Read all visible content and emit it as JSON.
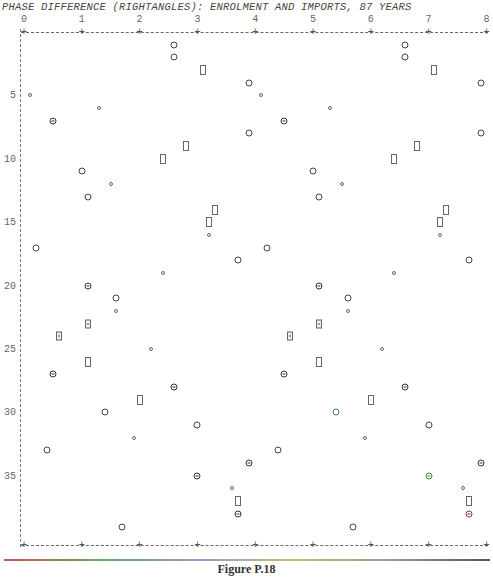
{
  "chart_data": {
    "type": "scatter",
    "title": "PHASE DIFFERENCE (RIGHTANGLES):  ENROLMENT AND IMPORTS, 87 YEARS",
    "xlabel": "Phase difference (right angles)",
    "ylabel": "Row / year index",
    "x_ticks": [
      "0",
      "1",
      "2",
      "3",
      "4",
      "5",
      "6",
      "7",
      "8"
    ],
    "y_ticks": [
      "5",
      "10",
      "15",
      "20",
      "25",
      "30",
      "35"
    ],
    "xlim": [
      0,
      8
    ],
    "ylim": [
      0,
      40
    ],
    "grid": false,
    "legend": null,
    "markers": {
      "circle": "large circle",
      "small": "small circle",
      "theta": "crossed circle",
      "rect": "open rectangle",
      "dbl": "boxed double symbol"
    },
    "points": [
      {
        "x": 2.6,
        "y": 1,
        "m": "circle"
      },
      {
        "x": 6.6,
        "y": 1,
        "m": "circle"
      },
      {
        "x": 2.6,
        "y": 2,
        "m": "circle"
      },
      {
        "x": 6.6,
        "y": 2,
        "m": "circle"
      },
      {
        "x": 3.1,
        "y": 3,
        "m": "rect"
      },
      {
        "x": 7.1,
        "y": 3,
        "m": "rect"
      },
      {
        "x": 3.9,
        "y": 4,
        "m": "circle"
      },
      {
        "x": 7.9,
        "y": 4,
        "m": "circle"
      },
      {
        "x": 0.1,
        "y": 5,
        "m": "small"
      },
      {
        "x": 4.1,
        "y": 5,
        "m": "small"
      },
      {
        "x": 1.3,
        "y": 6,
        "m": "small"
      },
      {
        "x": 5.3,
        "y": 6,
        "m": "small"
      },
      {
        "x": 0.5,
        "y": 7,
        "m": "theta"
      },
      {
        "x": 4.5,
        "y": 7,
        "m": "theta"
      },
      {
        "x": 3.9,
        "y": 8,
        "m": "circle"
      },
      {
        "x": 7.9,
        "y": 8,
        "m": "circle"
      },
      {
        "x": 2.8,
        "y": 9,
        "m": "rect"
      },
      {
        "x": 6.8,
        "y": 9,
        "m": "rect"
      },
      {
        "x": 2.4,
        "y": 10,
        "m": "rect"
      },
      {
        "x": 6.4,
        "y": 10,
        "m": "rect"
      },
      {
        "x": 1.0,
        "y": 11,
        "m": "circle"
      },
      {
        "x": 5.0,
        "y": 11,
        "m": "circle"
      },
      {
        "x": 1.5,
        "y": 12,
        "m": "small"
      },
      {
        "x": 5.5,
        "y": 12,
        "m": "small"
      },
      {
        "x": 1.1,
        "y": 13,
        "m": "circle"
      },
      {
        "x": 5.1,
        "y": 13,
        "m": "circle"
      },
      {
        "x": 3.3,
        "y": 14,
        "m": "rect"
      },
      {
        "x": 7.3,
        "y": 14,
        "m": "rect"
      },
      {
        "x": 3.2,
        "y": 15,
        "m": "rect"
      },
      {
        "x": 7.2,
        "y": 15,
        "m": "rect"
      },
      {
        "x": 3.2,
        "y": 16,
        "m": "small"
      },
      {
        "x": 7.2,
        "y": 16,
        "m": "small"
      },
      {
        "x": 0.2,
        "y": 17,
        "m": "circle"
      },
      {
        "x": 4.2,
        "y": 17,
        "m": "circle"
      },
      {
        "x": 3.7,
        "y": 18,
        "m": "circle"
      },
      {
        "x": 7.7,
        "y": 18,
        "m": "circle"
      },
      {
        "x": 2.4,
        "y": 19,
        "m": "small"
      },
      {
        "x": 6.4,
        "y": 19,
        "m": "small"
      },
      {
        "x": 1.1,
        "y": 20,
        "m": "theta"
      },
      {
        "x": 5.1,
        "y": 20,
        "m": "theta"
      },
      {
        "x": 1.6,
        "y": 21,
        "m": "circle"
      },
      {
        "x": 5.6,
        "y": 21,
        "m": "circle"
      },
      {
        "x": 1.6,
        "y": 22,
        "m": "small"
      },
      {
        "x": 5.6,
        "y": 22,
        "m": "small"
      },
      {
        "x": 1.1,
        "y": 23,
        "m": "dbl"
      },
      {
        "x": 5.1,
        "y": 23,
        "m": "dbl"
      },
      {
        "x": 0.6,
        "y": 24,
        "m": "dbl"
      },
      {
        "x": 4.6,
        "y": 24,
        "m": "dbl"
      },
      {
        "x": 2.2,
        "y": 25,
        "m": "small"
      },
      {
        "x": 6.2,
        "y": 25,
        "m": "small"
      },
      {
        "x": 1.1,
        "y": 26,
        "m": "rect"
      },
      {
        "x": 5.1,
        "y": 26,
        "m": "rect"
      },
      {
        "x": 0.5,
        "y": 27,
        "m": "theta"
      },
      {
        "x": 4.5,
        "y": 27,
        "m": "theta"
      },
      {
        "x": 2.6,
        "y": 28,
        "m": "theta"
      },
      {
        "x": 6.6,
        "y": 28,
        "m": "theta"
      },
      {
        "x": 2.0,
        "y": 29,
        "m": "rect"
      },
      {
        "x": 6.0,
        "y": 29,
        "m": "rect"
      },
      {
        "x": 1.4,
        "y": 30,
        "m": "circle"
      },
      {
        "x": 5.4,
        "y": 30,
        "m": "circle",
        "c": "green"
      },
      {
        "x": 3.0,
        "y": 31,
        "m": "circle"
      },
      {
        "x": 7.0,
        "y": 31,
        "m": "circle"
      },
      {
        "x": 1.9,
        "y": 32,
        "m": "small"
      },
      {
        "x": 5.9,
        "y": 32,
        "m": "small"
      },
      {
        "x": 0.4,
        "y": 33,
        "m": "circle"
      },
      {
        "x": 4.4,
        "y": 33,
        "m": "circle"
      },
      {
        "x": 3.9,
        "y": 34,
        "m": "theta"
      },
      {
        "x": 7.9,
        "y": 34,
        "m": "theta"
      },
      {
        "x": 3.0,
        "y": 35,
        "m": "theta"
      },
      {
        "x": 7.0,
        "y": 35,
        "m": "theta",
        "c": "green"
      },
      {
        "x": 3.6,
        "y": 36,
        "m": "small"
      },
      {
        "x": 7.6,
        "y": 36,
        "m": "small"
      },
      {
        "x": 3.7,
        "y": 37,
        "m": "rect"
      },
      {
        "x": 7.7,
        "y": 37,
        "m": "rect"
      },
      {
        "x": 3.7,
        "y": 38,
        "m": "theta"
      },
      {
        "x": 7.7,
        "y": 38,
        "m": "theta",
        "c": "red"
      },
      {
        "x": 1.7,
        "y": 39,
        "m": "circle"
      },
      {
        "x": 5.7,
        "y": 39,
        "m": "circle"
      }
    ]
  },
  "caption": "Figure P.18"
}
